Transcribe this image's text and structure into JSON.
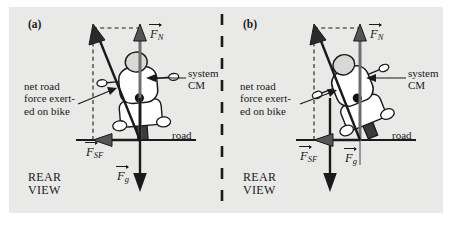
{
  "figure": {
    "background_color": "#e9e9e7",
    "ink_color": "#1a1a1a",
    "panel_count": 2
  },
  "panels": [
    {
      "tag": "(a)",
      "view_label_line1": "REAR",
      "view_label_line2": "VIEW",
      "road_label": "road",
      "cm_label_line1": "system",
      "cm_label_line2": "CM",
      "net_force_line1": "net road",
      "net_force_line2": "force exert-",
      "net_force_line3": "ed on bike",
      "forces": [
        {
          "symbol": "F",
          "subscript": "N",
          "name": "normal-force",
          "direction": "up"
        },
        {
          "symbol": "F",
          "subscript": "SF",
          "name": "static-friction-force",
          "direction": "left"
        },
        {
          "symbol": "F",
          "subscript": "g",
          "name": "gravitational-force",
          "direction": "down"
        }
      ],
      "lean": "slight"
    },
    {
      "tag": "(b)",
      "view_label_line1": "REAR",
      "view_label_line2": "VIEW",
      "road_label": "road",
      "cm_label_line1": "system",
      "cm_label_line2": "CM",
      "net_force_line1": "net road",
      "net_force_line2": "force exert-",
      "net_force_line3": "ed on bike",
      "forces": [
        {
          "symbol": "F",
          "subscript": "N",
          "name": "normal-force",
          "direction": "up"
        },
        {
          "symbol": "F",
          "subscript": "SF",
          "name": "static-friction-force",
          "direction": "left"
        },
        {
          "symbol": "F",
          "subscript": "g",
          "name": "gravitational-force",
          "direction": "down"
        }
      ],
      "lean": "steep"
    }
  ]
}
